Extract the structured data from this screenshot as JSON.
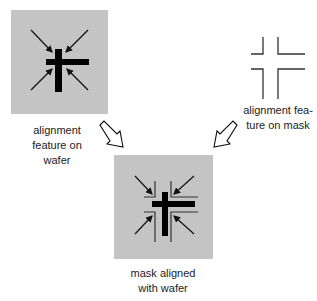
{
  "diagram": {
    "type": "photolithography mask alignment",
    "colors": {
      "wafer": "#c4c4c4",
      "feature": "#000000",
      "mask_line": "#333333",
      "text": "#222222"
    },
    "panels": [
      {
        "id": "wafer",
        "label_lines": [
          "alignment",
          "feature on",
          "wafer"
        ]
      },
      {
        "id": "mask",
        "label_lines": [
          "alignment fea-",
          "ture on mask"
        ]
      },
      {
        "id": "aligned",
        "label_lines": [
          "mask aligned",
          "with wafer"
        ]
      }
    ],
    "flow": [
      {
        "from": "wafer",
        "to": "aligned"
      },
      {
        "from": "mask",
        "to": "aligned"
      }
    ]
  }
}
